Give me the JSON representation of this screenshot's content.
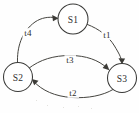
{
  "diagram": {
    "type": "state-machine",
    "canvas": {
      "width": 139,
      "height": 113
    },
    "colors": {
      "background": "#fefefe",
      "stroke": "#3a3a38",
      "edge": "#45443f",
      "text": "#2e2e2c"
    },
    "states": [
      {
        "id": "S1",
        "label": "S1",
        "cx": 73,
        "cy": 19,
        "r": 15
      },
      {
        "id": "S2",
        "label": "S2",
        "cx": 18,
        "cy": 77,
        "r": 14.5
      },
      {
        "id": "S3",
        "label": "S3",
        "cx": 122,
        "cy": 78,
        "r": 14.5
      }
    ],
    "transitions": [
      {
        "id": "t4",
        "label": "t4",
        "from": "S2",
        "to": "S1",
        "label_x": 28,
        "label_y": 33
      },
      {
        "id": "t1",
        "label": "t1",
        "from": "S1",
        "to": "S3",
        "label_x": 107,
        "label_y": 35
      },
      {
        "id": "t3",
        "label": "t3",
        "from": "S2",
        "to": "S3",
        "label_x": 70,
        "label_y": 60
      },
      {
        "id": "t2",
        "label": "t2",
        "from": "S3",
        "to": "S2",
        "label_x": 73,
        "label_y": 93
      }
    ]
  }
}
